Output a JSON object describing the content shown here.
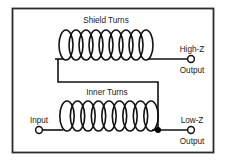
{
  "diagram": {
    "title_shield_coil": "Shield Turns",
    "title_inner_coil": "Inner Turns",
    "label_input": "Input",
    "label_high_z": "High-Z",
    "label_high_z_output": "Output",
    "label_low_z": "Low-Z",
    "label_low_z_output": "Output",
    "colors": {
      "border": "#2b2b2b",
      "wire": "#111111",
      "coil": "#111111",
      "background": "#ffffff",
      "text": "#1a1a1a",
      "junction": "#000000"
    },
    "shield_coil": {
      "turns": 9,
      "x_start": 62,
      "x_end": 152,
      "baseline_y": 59,
      "loop_height": 30,
      "loop_width": 14
    },
    "inner_coil": {
      "turns": 9,
      "x_start": 62,
      "x_end": 158,
      "baseline_y": 130,
      "loop_height": 30,
      "loop_width": 15
    },
    "terminals": [
      {
        "name": "input-terminal",
        "cx": 39,
        "cy": 130,
        "r": 3.4
      },
      {
        "name": "high-z-terminal",
        "cx": 191,
        "cy": 60,
        "r": 3.4
      },
      {
        "name": "low-z-terminal",
        "cx": 191,
        "cy": 130,
        "r": 3.4
      }
    ],
    "junction_dot": {
      "cx": 158,
      "cy": 130,
      "r": 3.0
    }
  }
}
